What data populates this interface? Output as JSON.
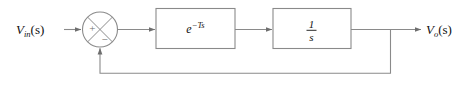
{
  "diagram": {
    "type": "control-system-block-diagram",
    "background_color": "#ffffff",
    "wire_color": "#8a8a8a",
    "text_color": "#111111",
    "sign_color": "#6e6e6e",
    "input": {
      "label_base": "V",
      "label_subscript": "in",
      "label_suffix": "(s)",
      "full_label": "V_in(s)"
    },
    "output": {
      "label_base": "V",
      "label_subscript": "o",
      "label_suffix": "(s)",
      "full_label": "V_o(s)"
    },
    "summing_junction": {
      "name": "summing-junction",
      "shape": "circle-with-x-cross",
      "positive_sign": "+",
      "negative_sign": "−",
      "positive_input": "from-input-Vin",
      "negative_input": "from-feedback"
    },
    "blocks": [
      {
        "id": "delay-block",
        "transfer_function": "e^{-Ts}",
        "base": "e",
        "exponent_minus": "−",
        "exponent_T": "T",
        "exponent_s": "s"
      },
      {
        "id": "integrator-block",
        "transfer_function": "1/s",
        "numerator": "1",
        "denominator": "s"
      }
    ],
    "feedback": {
      "name": "feedback-path",
      "gain": "1",
      "description": "unity negative feedback from output to summing junction"
    }
  }
}
